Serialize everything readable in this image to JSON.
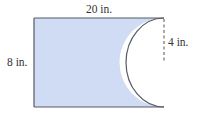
{
  "diagram": {
    "type": "geometry-figure",
    "labels": {
      "width": "20 in.",
      "height": "8 in.",
      "radius": "4 in."
    },
    "dimensions": {
      "width_in": 20,
      "height_in": 8,
      "semicircle_radius_in": 4
    },
    "colors": {
      "fill": "#cfdcf3",
      "stroke": "#555a66",
      "dashed": "#555555",
      "text": "#333333"
    }
  }
}
